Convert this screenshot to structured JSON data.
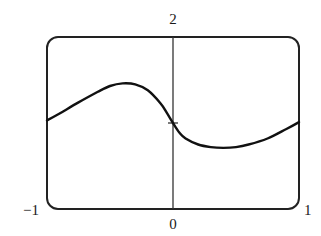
{
  "chart_data": {
    "type": "line",
    "title": "",
    "xlabel": "",
    "ylabel": "",
    "xlim": [
      -1,
      1
    ],
    "ylim": [
      0,
      2
    ],
    "grid": false,
    "legend": null,
    "frame": "rounded-rectangle viewing window",
    "tick_labels": {
      "x_min": "−1",
      "x_max": "1",
      "x_origin": "0",
      "y_max": "2"
    },
    "ticks": [
      {
        "x": 0,
        "y": 1,
        "label": ""
      }
    ],
    "series": [
      {
        "name": "curve",
        "x": [
          -1.0,
          -0.9,
          -0.75,
          -0.6,
          -0.5,
          -0.4,
          -0.3,
          -0.2,
          -0.1,
          -0.05,
          0.0,
          0.05,
          0.1,
          0.2,
          0.3,
          0.4,
          0.5,
          0.6,
          0.75,
          0.9,
          1.0
        ],
        "y": [
          1.03,
          1.11,
          1.24,
          1.36,
          1.43,
          1.46,
          1.45,
          1.38,
          1.23,
          1.12,
          1.0,
          0.89,
          0.82,
          0.75,
          0.72,
          0.71,
          0.72,
          0.75,
          0.82,
          0.93,
          1.01
        ]
      }
    ]
  },
  "labels": {
    "y_top": "2",
    "x_left": "−1",
    "x_right": "1",
    "x_zero": "0"
  },
  "colors": {
    "line": "#111111",
    "frame": "#222222",
    "axis": "#333333"
  }
}
